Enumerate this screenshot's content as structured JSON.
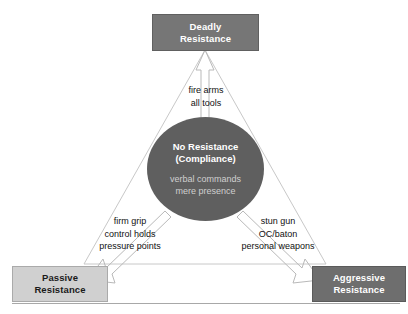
{
  "diagram": {
    "type": "triangle-continuum",
    "colors": {
      "deadly_box_bg": "#767676",
      "passive_box_bg": "#d0d0d0",
      "aggressive_box_bg": "#6e6e6e",
      "core_circle_bg": "#5f5f5f",
      "triangle_stroke": "#c8c8c8",
      "arrow_stroke": "#b5b5b5",
      "white_text": "#ffffff",
      "dark_text": "#1a1a1a",
      "muted_text": "#cfcfcf"
    }
  },
  "nodes": {
    "deadly": {
      "line1": "Deadly",
      "line2": "Resistance"
    },
    "passive": {
      "line1": "Passive",
      "line2": "Resistance"
    },
    "aggressive": {
      "line1": "Aggressive",
      "line2": "Resistance"
    },
    "core": {
      "title1": "No Resistance",
      "title2": "(Compliance)",
      "sub1": "verbal commands",
      "sub2": "mere presence"
    }
  },
  "edge_labels": {
    "top": {
      "line1": "fire arms",
      "line2": "all tools"
    },
    "left": {
      "line1": "firm grip",
      "line2": "control holds",
      "line3": "pressure points"
    },
    "right": {
      "line1": "stun gun",
      "line2": "OC/baton",
      "line3": "personal weapons"
    }
  }
}
